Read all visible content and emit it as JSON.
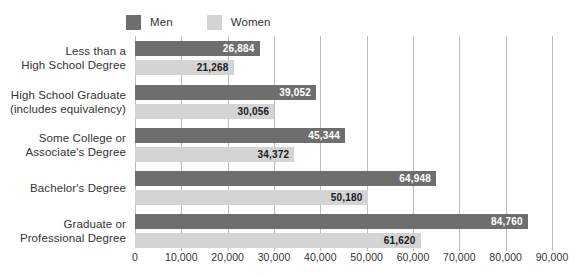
{
  "chart_data": {
    "type": "bar",
    "orientation": "horizontal",
    "title": "",
    "xlabel": "",
    "ylabel": "",
    "xlim": [
      0,
      90000
    ],
    "grid": true,
    "legend_position": "top-left",
    "categories": [
      "Less than a\nHigh School Degree",
      "High School Graduate\n(includes equivalency)",
      "Some College or\nAssociate's Degree",
      "Bachelor's Degree",
      "Graduate or\nProfessional Degree"
    ],
    "series": [
      {
        "name": "Men",
        "color": "#6e6e6e",
        "values": [
          26884,
          39052,
          45344,
          64948,
          84760
        ]
      },
      {
        "name": "Women",
        "color": "#d4d4d4",
        "values": [
          21268,
          30056,
          34372,
          50180,
          61620
        ]
      }
    ],
    "xticks": [
      0,
      10000,
      20000,
      30000,
      40000,
      50000,
      60000,
      70000,
      80000,
      90000
    ],
    "xtick_labels": [
      "0",
      "10,000",
      "20,000",
      "30,000",
      "40,000",
      "50,000",
      "60,000",
      "70,000",
      "80,000",
      "90,000"
    ]
  },
  "legend": {
    "men": {
      "label": "Men",
      "color": "#6e6e6e"
    },
    "women": {
      "label": "Women",
      "color": "#d4d4d4"
    }
  },
  "categories": [
    {
      "line1": "Less than a",
      "line2": "High School Degree"
    },
    {
      "line1": "High School Graduate",
      "line2": "(includes equivalency)"
    },
    {
      "line1": "Some College or",
      "line2": "Associate's Degree"
    },
    {
      "line1": "Bachelor's Degree",
      "line2": ""
    },
    {
      "line1": "Graduate or",
      "line2": "Professional Degree"
    }
  ],
  "values": {
    "men": [
      "26,884",
      "39,052",
      "45,344",
      "64,948",
      "84,760"
    ],
    "women": [
      "21,268",
      "30,056",
      "34,372",
      "50,180",
      "61,620"
    ]
  },
  "xaxis": {
    "labels": [
      "0",
      "10,000",
      "20,000",
      "30,000",
      "40,000",
      "50,000",
      "60,000",
      "70,000",
      "80,000",
      "90,000"
    ]
  }
}
